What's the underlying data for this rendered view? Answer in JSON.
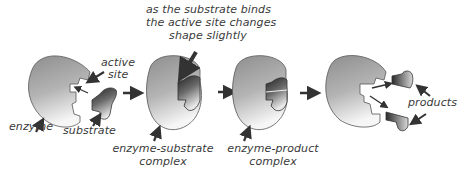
{
  "diagram": {
    "stages": [
      {
        "id": "enzyme-substrate-separate",
        "labels": [
          "enzyme",
          "active site",
          "substrate"
        ]
      },
      {
        "id": "enzyme-substrate-complex",
        "label_line1": "enzyme-substrate",
        "label_line2": "complex"
      },
      {
        "id": "enzyme-product-complex",
        "label_line1": "enzyme-product",
        "label_line2": "complex"
      },
      {
        "id": "products-released",
        "labels": [
          "products"
        ]
      }
    ],
    "labels": {
      "enzyme": "enzyme",
      "active_site_line1": "active",
      "active_site_line2": "site",
      "substrate": "substrate",
      "annotation_line1": "as the substrate binds",
      "annotation_line2": "the active site changes",
      "annotation_line3": "shape slightly",
      "es_complex_line1": "enzyme-substrate",
      "es_complex_line2": "complex",
      "ep_complex_line1": "enzyme-product",
      "ep_complex_line2": "complex",
      "products": "products"
    },
    "colors": {
      "enzyme_light": "#f4f4f4",
      "enzyme_dark": "#8a8a8a",
      "substrate_dark": "#2a2a2a",
      "substrate_light": "#dcdcdc",
      "arrow": "#333333",
      "text": "#3a3a3a"
    }
  }
}
